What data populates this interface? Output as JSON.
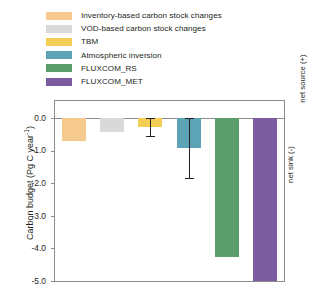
{
  "chart_data": {
    "type": "bar",
    "title": "",
    "xlabel": "",
    "ylabel": "Carbon budget  (Pg C year-1)",
    "ylabel_main": "Carbon budget  (Pg C year",
    "ylabel_sup": "-1",
    "ylabel_tail": ")",
    "ylim": [
      -5.0,
      0.0
    ],
    "grid": false,
    "legend_position": "above-plot",
    "y_ticks": [
      "0.0",
      "-1.0",
      "-2.0",
      "-3.0",
      "-4.0",
      "-5.0"
    ],
    "y_tick_values": [
      0.0,
      -1.0,
      -2.0,
      -3.0,
      -4.0,
      -5.0
    ],
    "categories": [
      "Inventory-based carbon stock changes",
      "VOD-based carbon stock changes",
      "TBM",
      "Atmospheric inversion",
      "FLUXCOM_RS",
      "FLUXCOM_MET"
    ],
    "values": [
      -0.7,
      -0.42,
      -0.28,
      -0.92,
      -4.26,
      -5.05
    ],
    "errors": [
      null,
      null,
      0.27,
      0.92,
      null,
      null
    ],
    "colors": [
      "#f6ca8e",
      "#d9d9d9",
      "#f2ce55",
      "#5ba3b5",
      "#5b9e6b",
      "#7b5c9e"
    ],
    "annotations": [
      {
        "text": "net source (+)",
        "position": "right-axis-top"
      },
      {
        "text": "net sink (-)",
        "position": "right-axis-bottom"
      }
    ]
  },
  "legend": {
    "items": [
      {
        "label": "Inventory-based carbon stock changes",
        "color": "#f6ca8e"
      },
      {
        "label": "VOD-based carbon stock changes",
        "color": "#d9d9d9"
      },
      {
        "label": "TBM",
        "color": "#f2ce55"
      },
      {
        "label": "Atmospheric inversion",
        "color": "#5ba3b5"
      },
      {
        "label": "FLUXCOM_RS",
        "color": "#5b9e6b"
      },
      {
        "label": "FLUXCOM_MET",
        "color": "#7b5c9e"
      }
    ]
  },
  "axes": {
    "right_top_label": "net source (+)",
    "right_bottom_label": "net sink (-)"
  }
}
